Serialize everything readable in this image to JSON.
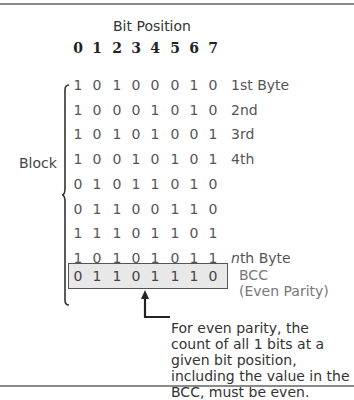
{
  "diagram": {
    "title": "Bit Position",
    "bit_positions": [
      "0",
      "1",
      "2",
      "3",
      "4",
      "5",
      "6",
      "7"
    ],
    "block_label": "Block",
    "rows": [
      {
        "bits": [
          "1",
          "0",
          "1",
          "0",
          "0",
          "0",
          "1",
          "0"
        ],
        "label": "1st Byte"
      },
      {
        "bits": [
          "1",
          "0",
          "0",
          "0",
          "1",
          "0",
          "1",
          "0"
        ],
        "label": "2nd"
      },
      {
        "bits": [
          "1",
          "0",
          "1",
          "0",
          "1",
          "0",
          "0",
          "1"
        ],
        "label": "3rd"
      },
      {
        "bits": [
          "1",
          "0",
          "0",
          "1",
          "0",
          "1",
          "0",
          "1"
        ],
        "label": "4th"
      },
      {
        "bits": [
          "0",
          "1",
          "0",
          "1",
          "1",
          "0",
          "1",
          "0"
        ],
        "label": ""
      },
      {
        "bits": [
          "0",
          "1",
          "1",
          "0",
          "0",
          "1",
          "1",
          "0"
        ],
        "label": ""
      },
      {
        "bits": [
          "1",
          "1",
          "1",
          "0",
          "1",
          "1",
          "0",
          "1"
        ],
        "label": ""
      },
      {
        "bits": [
          "1",
          "0",
          "1",
          "0",
          "1",
          "0",
          "1",
          "1"
        ],
        "label_italic": "n",
        "label": "th Byte"
      }
    ],
    "bcc": {
      "bits": [
        "0",
        "1",
        "1",
        "0",
        "1",
        "1",
        "1",
        "0"
      ],
      "label_line1": "BCC",
      "label_line2": "(Even Parity)"
    },
    "note": "For even parity, the count of all 1 bits at a given bit position, including the value in the BCC, must be even.",
    "colors": {
      "rule": "#8a8a8a",
      "bcc_fill": "#e8e8e8",
      "text": "#333333"
    }
  }
}
